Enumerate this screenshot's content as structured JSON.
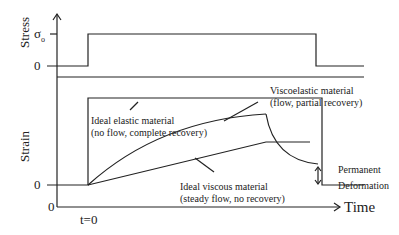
{
  "diagram": {
    "axes": {
      "stress_label": "Stress",
      "strain_label": "Strain",
      "time_label": "Time",
      "sigma0": "σ",
      "sigma0_sub": "o",
      "stress_zero": "0",
      "strain_zero": "0",
      "origin": "0",
      "t0": "t=0"
    },
    "annotations": {
      "elastic": [
        "Ideal elastic material",
        "(no flow, complete recovery)"
      ],
      "viscoelastic": [
        "Viscoelastic material",
        "(flow, partial recovery)"
      ],
      "viscous": [
        "Ideal viscous material",
        "(steady flow, no recovery)"
      ],
      "permanent": [
        "Permanent",
        "Deformation"
      ]
    }
  }
}
